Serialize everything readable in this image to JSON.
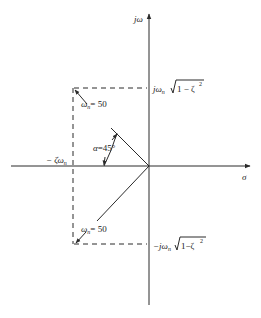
{
  "diagram": {
    "axes": {
      "vertical_label": "jω",
      "horizontal_label": "σ"
    },
    "labels": {
      "upper_imag": "jωₙ√(1 − ζ²)",
      "upper_imag_prefix": "jω",
      "upper_imag_sub": "n",
      "upper_imag_root": "1 − ζ",
      "upper_imag_exp": "2",
      "lower_imag_prefix": "−jω",
      "lower_imag_sub": "n",
      "lower_imag_root": "1−ζ",
      "lower_imag_exp": "2",
      "real_part_prefix": "− ζω",
      "real_part_sub": "n",
      "upper_vector": "ωₙ = 50",
      "upper_vector_prefix": "ω",
      "upper_vector_sub": "n",
      "upper_vector_value": "= 50",
      "lower_vector_prefix": "ω",
      "lower_vector_sub": "n",
      "lower_vector_value": "= 50",
      "angle_prefix": "α",
      "angle_value": "=45°"
    },
    "values": {
      "omega_n": 50,
      "alpha_deg": 45
    },
    "colors": {
      "ink": "#2a2a2a",
      "background": "#ffffff"
    }
  }
}
